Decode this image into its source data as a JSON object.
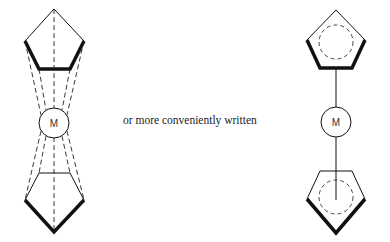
{
  "caption": "or more conveniently written",
  "left_structure": {
    "metal_label": "M",
    "description": "sandwich complex with dashed bonds from metal to each ring vertex"
  },
  "right_structure": {
    "metal_label": "M",
    "description": "simplified sandwich with single bonds to aromatic ring centroids"
  },
  "colors": {
    "line": "#111111",
    "background": "#ffffff"
  }
}
